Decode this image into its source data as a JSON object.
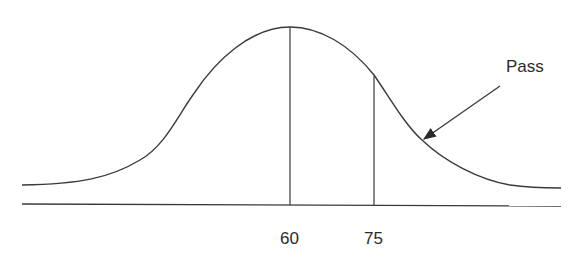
{
  "diagram": {
    "type": "normal-distribution-curve",
    "annotation": "Pass",
    "tick_labels": [
      "60",
      "75"
    ],
    "markers": [
      {
        "label": "60",
        "meaning": "mean / peak"
      },
      {
        "label": "75",
        "meaning": "pass threshold"
      }
    ],
    "colors": {
      "line": "#3a3a3a",
      "background": "#ffffff"
    }
  }
}
